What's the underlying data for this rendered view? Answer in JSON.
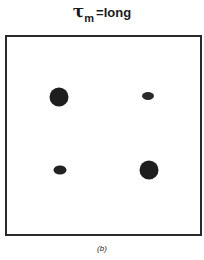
{
  "title": {
    "symbol": "τ",
    "subscript": "m",
    "suffix": "=long"
  },
  "panel": {
    "border_color": "#2a2a2a",
    "background": "#ffffff",
    "dots": [
      {
        "label": "top-left",
        "cx": 52,
        "cy": 60,
        "w": 19,
        "h": 19,
        "color": "#1e1e1e"
      },
      {
        "label": "top-right",
        "cx": 141,
        "cy": 59,
        "w": 12,
        "h": 8,
        "color": "#2a2a2a"
      },
      {
        "label": "bottom-left",
        "cx": 53,
        "cy": 133,
        "w": 13,
        "h": 9,
        "color": "#222222"
      },
      {
        "label": "bottom-right",
        "cx": 142,
        "cy": 133,
        "w": 19,
        "h": 19,
        "color": "#1e1e1e"
      }
    ]
  },
  "caption": "(b)"
}
